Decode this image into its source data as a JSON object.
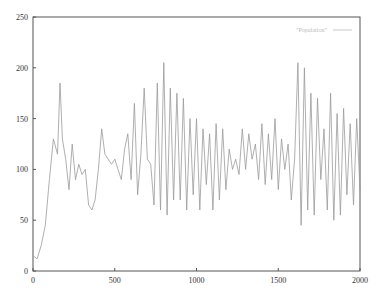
{
  "chart_data": {
    "type": "line",
    "title": "",
    "xlabel": "",
    "ylabel": "",
    "xlim": [
      0,
      2000
    ],
    "ylim": [
      0,
      250
    ],
    "xticks": [
      "0",
      "500",
      "1000",
      "1500",
      "2000"
    ],
    "yticks": [
      "0",
      "50",
      "100",
      "150",
      "200",
      "250"
    ],
    "grid": false,
    "legend_position": "top-right",
    "series": [
      {
        "name": "Population",
        "color": "#9a9a9a",
        "x": [
          0,
          25,
          50,
          75,
          100,
          125,
          150,
          165,
          180,
          200,
          220,
          240,
          260,
          280,
          300,
          320,
          340,
          360,
          380,
          400,
          420,
          440,
          460,
          480,
          500,
          520,
          540,
          560,
          580,
          600,
          620,
          640,
          660,
          680,
          700,
          720,
          740,
          760,
          780,
          800,
          820,
          840,
          860,
          880,
          900,
          920,
          940,
          960,
          980,
          1000,
          1020,
          1040,
          1060,
          1080,
          1100,
          1120,
          1140,
          1160,
          1180,
          1200,
          1220,
          1240,
          1260,
          1280,
          1300,
          1320,
          1340,
          1360,
          1380,
          1400,
          1420,
          1440,
          1460,
          1480,
          1500,
          1520,
          1540,
          1560,
          1580,
          1600,
          1620,
          1640,
          1660,
          1680,
          1700,
          1720,
          1740,
          1760,
          1780,
          1800,
          1820,
          1840,
          1860,
          1880,
          1900,
          1920,
          1940,
          1960,
          1980,
          2000
        ],
        "values": [
          15,
          12,
          25,
          45,
          90,
          130,
          115,
          185,
          130,
          110,
          80,
          125,
          90,
          105,
          95,
          100,
          65,
          60,
          70,
          100,
          140,
          115,
          110,
          105,
          110,
          100,
          90,
          120,
          135,
          90,
          165,
          75,
          115,
          180,
          110,
          105,
          65,
          185,
          60,
          205,
          55,
          180,
          70,
          175,
          70,
          170,
          60,
          150,
          75,
          150,
          60,
          140,
          85,
          135,
          60,
          145,
          70,
          140,
          80,
          120,
          100,
          110,
          95,
          140,
          100,
          135,
          110,
          125,
          90,
          145,
          85,
          135,
          90,
          150,
          80,
          130,
          100,
          125,
          70,
          110,
          205,
          45,
          200,
          60,
          175,
          55,
          170,
          90,
          140,
          60,
          175,
          50,
          155,
          55,
          160,
          75,
          145,
          65,
          150,
          80
        ]
      }
    ]
  },
  "legend": {
    "label": "\"Population\""
  },
  "axes": {
    "x_tick_labels": [
      "0",
      "500",
      "1000",
      "1500",
      "2000"
    ],
    "y_tick_labels": [
      "0",
      "50",
      "100",
      "150",
      "200",
      "250"
    ]
  }
}
